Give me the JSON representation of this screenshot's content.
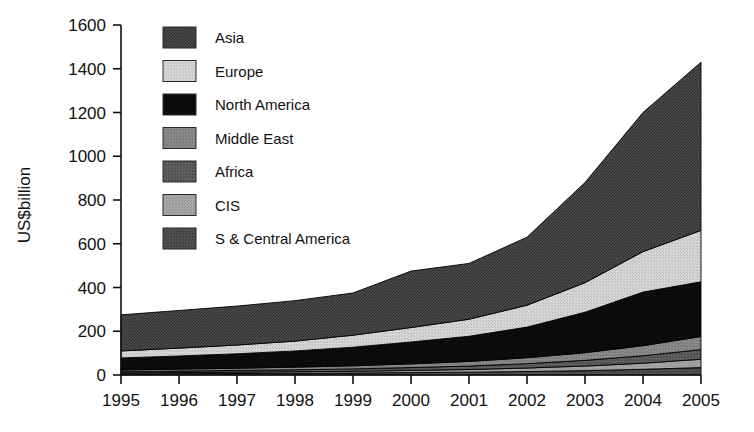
{
  "chart_data": {
    "type": "area",
    "stacked": true,
    "title": "",
    "subtitle": "",
    "xlabel": "",
    "ylabel": "US$billion",
    "xlim": [
      1995,
      2005
    ],
    "ylim": [
      0,
      1600
    ],
    "grid": false,
    "legend_position": "top-left-inside",
    "x": [
      1995,
      1996,
      1997,
      1998,
      1999,
      2000,
      2001,
      2002,
      2003,
      2004,
      2005
    ],
    "x_tick_labels": [
      "1995",
      "1996",
      "1997",
      "1998",
      "1999",
      "2000",
      "2001",
      "2002",
      "2003",
      "2004",
      "2005"
    ],
    "y_tick_labels": [
      "0",
      "200",
      "400",
      "600",
      "800",
      "1000",
      "1200",
      "1400",
      "1600"
    ],
    "y_ticks": [
      0,
      200,
      400,
      600,
      800,
      1000,
      1200,
      1400,
      1600
    ],
    "stack_order_bottom_to_top": [
      "S & Central America",
      "CIS",
      "Africa",
      "Middle East",
      "North America",
      "Europe",
      "Asia"
    ],
    "series": [
      {
        "name": "S & Central America",
        "color": "#4a4a4a",
        "values": [
          5,
          6,
          7,
          8,
          9,
          11,
          13,
          16,
          20,
          26,
          34
        ]
      },
      {
        "name": "CIS",
        "color": "#9a9a9a",
        "values": [
          4,
          5,
          6,
          7,
          8,
          10,
          12,
          16,
          21,
          28,
          38
        ]
      },
      {
        "name": "Africa",
        "color": "#585858",
        "values": [
          6,
          7,
          8,
          9,
          11,
          13,
          16,
          20,
          26,
          34,
          44
        ]
      },
      {
        "name": "Middle East",
        "color": "#7d7d7d",
        "values": [
          8,
          9,
          10,
          12,
          14,
          17,
          21,
          27,
          35,
          46,
          60
        ]
      },
      {
        "name": "North America",
        "color": "#0b0b0b",
        "values": [
          55,
          60,
          66,
          74,
          85,
          100,
          115,
          140,
          185,
          245,
          250
        ]
      },
      {
        "name": "Europe",
        "color": "#c8c8c8",
        "values": [
          32,
          36,
          40,
          45,
          55,
          66,
          78,
          100,
          135,
          185,
          235
        ]
      },
      {
        "name": "Asia",
        "color": "#3c3c3c",
        "values": [
          165,
          172,
          178,
          185,
          193,
          258,
          255,
          311,
          458,
          636,
          769
        ]
      }
    ],
    "totals": [
      275,
      295,
      315,
      340,
      375,
      475,
      510,
      630,
      880,
      1200,
      1430
    ],
    "legend_entries": [
      {
        "label": "Asia",
        "color": "#3c3c3c"
      },
      {
        "label": "Europe",
        "color": "#c8c8c8"
      },
      {
        "label": "North America",
        "color": "#0b0b0b"
      },
      {
        "label": "Middle East",
        "color": "#7d7d7d"
      },
      {
        "label": "Africa",
        "color": "#585858"
      },
      {
        "label": "CIS",
        "color": "#9a9a9a"
      },
      {
        "label": "S & Central America",
        "color": "#4a4a4a"
      }
    ]
  }
}
